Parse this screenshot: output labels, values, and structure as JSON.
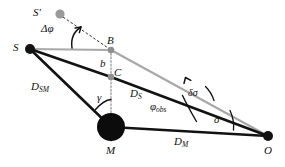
{
  "figure": {
    "type": "gravitational-lensing-geometry",
    "background_color": "#ffffff",
    "width": 285,
    "height": 167
  },
  "colors": {
    "black": "#121212",
    "gray_ray": "#a8a8a8",
    "gray_point": "#9a9a9a",
    "dotted_gray": "#b0b0b0",
    "label": "#111111"
  },
  "points": [
    {
      "id": "S_prime",
      "label": "S′",
      "x": 60,
      "y": 14,
      "marker": "gray-dot",
      "radius": 4.5,
      "label_x": 33,
      "label_y": 8
    },
    {
      "id": "S",
      "label": "S",
      "x": 30,
      "y": 49,
      "marker": "black-dot",
      "radius": 5.0,
      "label_x": 13,
      "label_y": 43
    },
    {
      "id": "B",
      "label": "B",
      "x": 111,
      "y": 50,
      "marker": "gray-dot",
      "radius": 3.2,
      "label_x": 108,
      "label_y": 36
    },
    {
      "id": "C",
      "label": "C",
      "x": 111,
      "y": 77,
      "marker": "gray-dot",
      "radius": 3.2,
      "label_x": 114,
      "label_y": 67
    },
    {
      "id": "M",
      "label": "M",
      "x": 111,
      "y": 127,
      "marker": "black-disk",
      "radius": 14.0,
      "label_x": 107,
      "label_y": 146
    },
    {
      "id": "O",
      "label": "O",
      "x": 268,
      "y": 136,
      "marker": "black-dot",
      "radius": 5.0,
      "label_x": 265,
      "label_y": 146
    }
  ],
  "segments": [
    {
      "id": "S-to-B",
      "from": "S",
      "to": "B",
      "style": "solid",
      "color": "gray_ray",
      "width": 2.2
    },
    {
      "id": "B-to-O",
      "from": "B",
      "to": "O",
      "style": "solid",
      "color": "gray_ray",
      "width": 2.2
    },
    {
      "id": "S-to-C",
      "from": "S",
      "to": "C",
      "style": "solid",
      "color": "black",
      "width": 2.6
    },
    {
      "id": "C-to-O",
      "from": "C",
      "to": "O",
      "style": "solid",
      "color": "black",
      "width": 2.6
    },
    {
      "id": "S-to-M",
      "from": "S",
      "to": "M",
      "style": "solid",
      "color": "black",
      "width": 2.6
    },
    {
      "id": "M-to-O",
      "from": "M",
      "to": "O",
      "style": "solid",
      "color": "black",
      "width": 2.2
    },
    {
      "id": "Sprime-to-B",
      "from": "S_prime",
      "to": "B",
      "style": "dashed",
      "color": "black",
      "width": 1.0
    },
    {
      "id": "B-through-C-to-M",
      "from": "B",
      "to": "M",
      "style": "dotted",
      "color": "dotted_gray",
      "width": 1.6
    }
  ],
  "distance_labels": [
    {
      "id": "D_SM",
      "base": "D",
      "sub": "SM",
      "x": 34,
      "y": 86
    },
    {
      "id": "D_S",
      "base": "D",
      "sub": "S",
      "x": 131,
      "y": 93
    },
    {
      "id": "D_M",
      "base": "D",
      "sub": "M",
      "x": 176,
      "y": 140
    },
    {
      "id": "b",
      "base": "b",
      "sub": "",
      "x": 101,
      "y": 60
    }
  ],
  "angle_labels": [
    {
      "id": "delta-phi",
      "text": "Δφ",
      "x": 45,
      "y": 28,
      "description": "source-image angular offset at B"
    },
    {
      "id": "gamma",
      "text": "γ",
      "x": 99,
      "y": 96,
      "description": "angle at M between MS and MB"
    },
    {
      "id": "phi-obs",
      "base": "φ",
      "sub": "obs",
      "x": 153,
      "y": 105,
      "description": "observed angle at O"
    },
    {
      "id": "delta-sigma",
      "text": "δσ",
      "x": 191,
      "y": 93,
      "description": "deflection angle increment at O"
    },
    {
      "id": "sigma",
      "text": "σ",
      "x": 215,
      "y": 118,
      "description": "angle at O between OM and OC"
    }
  ],
  "arcs": [
    {
      "id": "arc-delta-phi",
      "center": "B",
      "label": "delta-phi",
      "arrow": true
    },
    {
      "id": "arc-gamma",
      "center": "M",
      "label": "gamma",
      "arrow": false
    },
    {
      "id": "arc-phi-obs",
      "center": "O",
      "label": "phi-obs",
      "arrow": false
    },
    {
      "id": "arc-delta-sigma",
      "center": "O",
      "label": "delta-sigma",
      "arrow": true
    },
    {
      "id": "arc-sigma",
      "center": "O",
      "label": "sigma",
      "arrow": false
    }
  ]
}
